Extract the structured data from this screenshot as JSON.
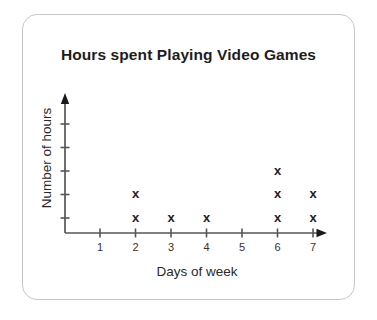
{
  "chart_data": {
    "type": "scatter",
    "title": "Hours spent Playing Video Games",
    "xlabel": "Days of week",
    "ylabel": "Number of hours",
    "marker": "x",
    "x_ticks": [
      "1",
      "2",
      "3",
      "4",
      "5",
      "6",
      "7"
    ],
    "y_ticks": [
      1,
      2,
      3,
      4,
      5
    ],
    "y_tick_labels": [
      "",
      "",
      "",
      "",
      ""
    ],
    "xlim": [
      0,
      7.7
    ],
    "ylim": [
      0,
      5.9
    ],
    "grid": false,
    "legend": false,
    "points": [
      {
        "x": 2,
        "y": 1
      },
      {
        "x": 2,
        "y": 2
      },
      {
        "x": 3,
        "y": 1
      },
      {
        "x": 4,
        "y": 1
      },
      {
        "x": 6,
        "y": 1
      },
      {
        "x": 6,
        "y": 2
      },
      {
        "x": 6,
        "y": 3
      },
      {
        "x": 7,
        "y": 1
      },
      {
        "x": 7,
        "y": 2
      }
    ],
    "colors": {
      "marker": "#222222",
      "axis": "#565656",
      "arrow": "#1a1a1a",
      "tick_text": "#333333",
      "title_text": "#1d1d1d",
      "label_text": "#2a2a2a",
      "card_border": "#c6c6c6",
      "card_bg": "#ffffff",
      "page_bg": "#ffffff"
    }
  }
}
